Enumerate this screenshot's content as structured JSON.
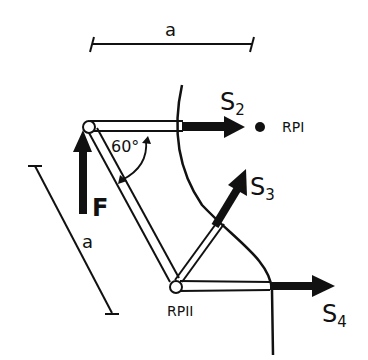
{
  "diagram": {
    "type": "truss-method-of-sections",
    "dimension_top": {
      "label": "a"
    },
    "dimension_diagonal": {
      "label": "a"
    },
    "angle": {
      "label": "60°"
    },
    "force": {
      "label": "F",
      "direction": "up"
    },
    "member_forces": [
      {
        "name": "S",
        "subscript": "2"
      },
      {
        "name": "S",
        "subscript": "3"
      },
      {
        "name": "S",
        "subscript": "4"
      }
    ],
    "reference_points": [
      {
        "label": "RPI"
      },
      {
        "label": "RPII"
      }
    ],
    "colors": {
      "ink": "#111111",
      "background": "#ffffff"
    }
  }
}
